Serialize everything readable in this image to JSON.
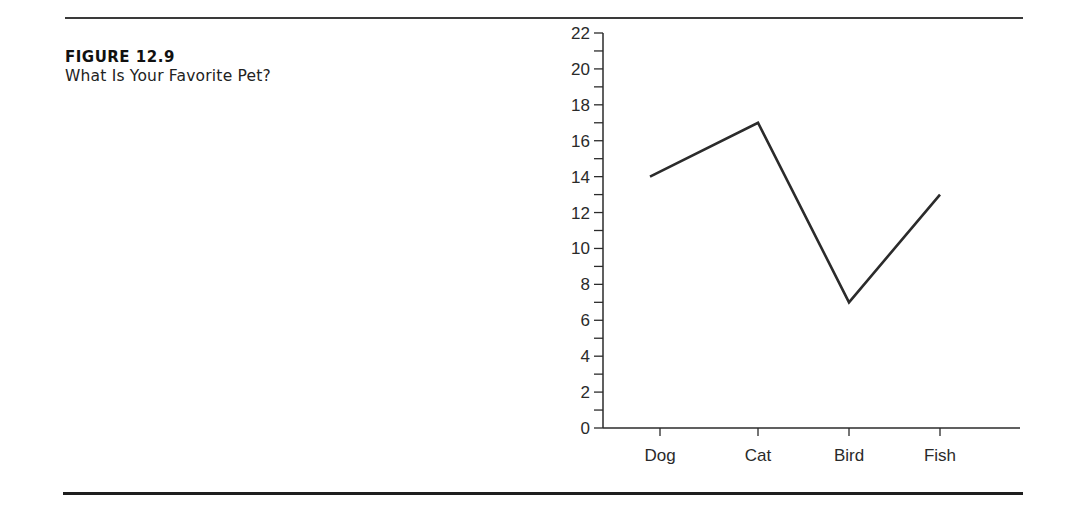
{
  "figure": {
    "label": "FIGURE 12.9",
    "title": "What Is Your Favorite Pet?"
  },
  "chart_data": {
    "type": "line",
    "title": "What Is Your Favorite Pet?",
    "categories": [
      "Dog",
      "Cat",
      "Bird",
      "Fish"
    ],
    "values": [
      14,
      17,
      7,
      13
    ],
    "xlabel": "",
    "ylabel": "",
    "ylim": [
      0,
      22
    ],
    "yticks": [
      0,
      2,
      4,
      6,
      8,
      10,
      12,
      14,
      16,
      18,
      20,
      22
    ],
    "minor_ytick_step": 1,
    "grid": false,
    "legend": null,
    "line_color": "#2b2b2b"
  }
}
